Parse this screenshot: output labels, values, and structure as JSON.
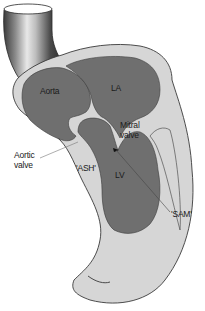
{
  "diagram": {
    "labels": {
      "aorta": "Aorta",
      "la": "LA",
      "mitral_valve": "Mitral\nvalve",
      "aortic_valve": "Aortic\nvalve",
      "ash": "'ASH'",
      "lv": "LV",
      "sam": "'SAM'"
    },
    "colors": {
      "background": "#ffffff",
      "wall": "#d6d6d6",
      "chamber": "#6f6f6f",
      "outline": "#3a3a3a",
      "pointer_line": "#555555"
    }
  }
}
